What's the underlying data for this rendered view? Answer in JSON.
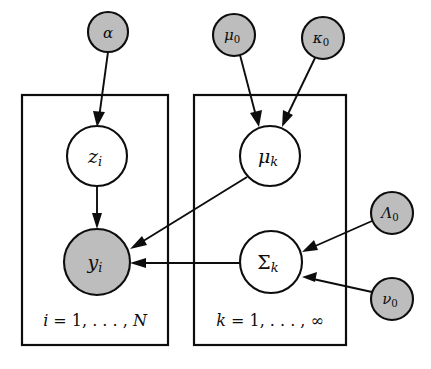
{
  "figure": {
    "background_color": "#ffffff",
    "stroke_color": "#0d0d0d",
    "shaded_fill": "#bdbdbd",
    "latent_fill": "#ffffff"
  },
  "nodes": [
    {
      "id": "alpha",
      "label": "α",
      "subscript": "",
      "type": "hyperparameter",
      "shaded": true,
      "cx": 108,
      "cy": 32,
      "r": 20
    },
    {
      "id": "mu0",
      "label": "μ",
      "subscript": "0",
      "type": "hyperparameter",
      "shaded": true,
      "cx": 234,
      "cy": 35,
      "r": 21
    },
    {
      "id": "kappa0",
      "label": "κ",
      "subscript": "0",
      "type": "hyperparameter",
      "shaded": true,
      "cx": 323,
      "cy": 38,
      "r": 21
    },
    {
      "id": "lambda0",
      "label": "Λ",
      "subscript": "0",
      "type": "hyperparameter",
      "shaded": true,
      "cx": 392,
      "cy": 213,
      "r": 21
    },
    {
      "id": "nu0",
      "label": "ν",
      "subscript": "0",
      "type": "hyperparameter",
      "shaded": true,
      "cx": 392,
      "cy": 299,
      "r": 21
    },
    {
      "id": "z_i",
      "label": "z",
      "subscript": "i",
      "type": "latent",
      "shaded": false,
      "cx": 97,
      "cy": 156,
      "r": 30
    },
    {
      "id": "y_i",
      "label": "y",
      "subscript": "i",
      "type": "observed",
      "shaded": true,
      "cx": 97,
      "cy": 262,
      "r": 33
    },
    {
      "id": "mu_k",
      "label": "μ",
      "subscript": "k",
      "type": "latent",
      "shaded": false,
      "cx": 270,
      "cy": 156,
      "r": 30
    },
    {
      "id": "sigma_k",
      "label": "Σ",
      "subscript": "k",
      "type": "latent",
      "shaded": false,
      "cx": 271,
      "cy": 262,
      "r": 31
    }
  ],
  "edges": [
    {
      "id": "alpha-to-z",
      "from": "alpha",
      "to": "z_i"
    },
    {
      "id": "z-to-y",
      "from": "z_i",
      "to": "y_i"
    },
    {
      "id": "mu0-to-muk",
      "from": "mu0",
      "to": "mu_k"
    },
    {
      "id": "kappa0-to-muk",
      "from": "kappa0",
      "to": "mu_k"
    },
    {
      "id": "muk-to-y",
      "from": "mu_k",
      "to": "y_i"
    },
    {
      "id": "sigmak-to-y",
      "from": "sigma_k",
      "to": "y_i"
    },
    {
      "id": "lambda0-to-sigmak",
      "from": "lambda0",
      "to": "sigma_k"
    },
    {
      "id": "nu0-to-sigmak",
      "from": "nu0",
      "to": "sigma_k"
    }
  ],
  "plates": [
    {
      "id": "plate-data",
      "label_var": "i",
      "label_eq": " = 1",
      "label_dots": ", . . . , ",
      "label_bound": "N",
      "x": 22,
      "y": 95,
      "w": 146,
      "h": 250,
      "label_cx": 95,
      "label_cy": 320
    },
    {
      "id": "plate-components",
      "label_var": "k",
      "label_eq": " = 1",
      "label_dots": ", . . . , ",
      "label_bound": "∞",
      "x": 194,
      "y": 95,
      "w": 152,
      "h": 250,
      "label_cx": 270,
      "label_cy": 320
    }
  ]
}
